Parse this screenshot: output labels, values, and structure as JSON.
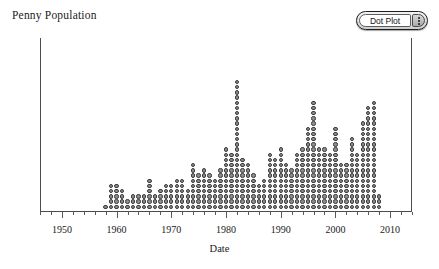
{
  "chart_title": "Penny Population",
  "controls": {
    "plot_type_label": "Dot Plot",
    "menu_icon": "kebab-vertical-icon"
  },
  "axis": {
    "x_title": "Date",
    "x_tick_labels": [
      "1950",
      "1960",
      "1970",
      "1980",
      "1990",
      "2000",
      "2010"
    ],
    "y_title": ""
  },
  "chart_data": {
    "type": "dot",
    "title": "Penny Population",
    "xlabel": "Date",
    "ylabel": "",
    "xlim": [
      1946,
      2014
    ],
    "ylim": [
      0,
      34
    ],
    "grid": false,
    "legend": "none",
    "dot_fill": "#8d8d8d",
    "dot_stroke": "#3b3b3b",
    "axis_color": "#4c4c4c",
    "x_major_ticks": [
      1950,
      1960,
      1970,
      1980,
      1990,
      2000,
      2010
    ],
    "x_minor_tick_step": 2,
    "x": [
      1958,
      1959,
      1960,
      1961,
      1962,
      1963,
      1964,
      1965,
      1966,
      1967,
      1968,
      1969,
      1970,
      1971,
      1972,
      1973,
      1974,
      1975,
      1976,
      1977,
      1978,
      1979,
      1980,
      1981,
      1982,
      1983,
      1984,
      1985,
      1986,
      1987,
      1988,
      1989,
      1990,
      1991,
      1992,
      1993,
      1994,
      1995,
      1996,
      1997,
      1998,
      1999,
      2000,
      2001,
      2002,
      2003,
      2004,
      2005,
      2006,
      2007,
      2008
    ],
    "counts": [
      1,
      5,
      5,
      4,
      2,
      3,
      3,
      3,
      6,
      3,
      4,
      5,
      5,
      6,
      6,
      4,
      9,
      7,
      8,
      7,
      6,
      8,
      12,
      11,
      25,
      10,
      9,
      7,
      5,
      6,
      11,
      10,
      12,
      9,
      8,
      11,
      12,
      16,
      21,
      12,
      12,
      11,
      16,
      9,
      9,
      14,
      11,
      17,
      20,
      21,
      3
    ],
    "xlabel_note": "Year of minting"
  }
}
